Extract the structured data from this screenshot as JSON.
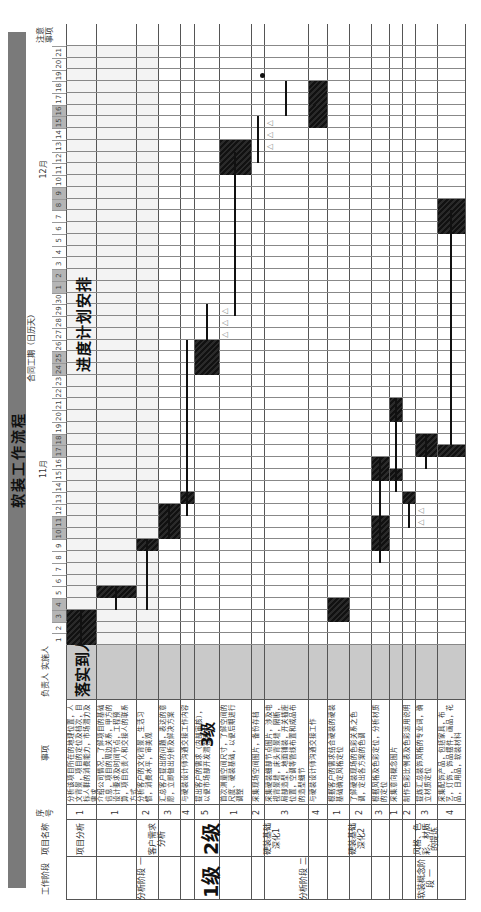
{
  "document": {
    "title": "软装工作流程",
    "contract_period_label": "合同工期（日历天）",
    "plan_label": "进度计划安排",
    "implementer_overlay": "落实到人",
    "level1_overlay": "1级",
    "level2_overlay": "2级",
    "level3_overlay": "3级",
    "headers": {
      "work_stage": "工作阶段",
      "project_name": "项目名称",
      "seq_no": "序号",
      "matters": "事项",
      "responsible": "负责人",
      "implementer": "实施人",
      "notes": "注意事项"
    },
    "months": [
      {
        "label": "11月",
        "start_day": 1,
        "days": 30
      },
      {
        "label": "12月",
        "start_day": 1,
        "days": 21
      }
    ],
    "weekend_days": [
      3,
      4,
      10,
      11,
      17,
      18,
      24,
      25,
      31,
      32,
      38,
      39,
      45,
      46
    ],
    "stages": [
      {
        "label": "分析阶段",
        "number": "一",
        "rows": [
          0,
          5
        ]
      },
      {
        "label": "分析阶段",
        "number": "二",
        "rows": [
          6,
          12
        ]
      },
      {
        "label": "软装概念阶段",
        "number": "一",
        "rows": [
          13,
          16
        ]
      }
    ],
    "projects": [
      {
        "label": "项目分析",
        "number": "一",
        "rows": [
          0,
          0
        ]
      },
      {
        "label": "客户需求分析",
        "number": "二",
        "rows": [
          1,
          5
        ]
      },
      {
        "label": "硬装基础深化1",
        "number": "三",
        "rows": [
          6,
          9
        ]
      },
      {
        "label": "硬装基础深化2",
        "number": "三",
        "rows": [
          10,
          12
        ]
      },
      {
        "label": "风格、色彩、材质的提炼",
        "number": "四",
        "rows": [
          13,
          16
        ]
      }
    ],
    "tasks": [
      {
        "seq": "1",
        "text": "分析该项目所在的地理位置，人文背景，项目的定位及档次，目标人群的消费能力，市场潜力及需求"
      },
      {
        "seq": "1",
        "text": "介绍公司情况，了解项目的基础信息，项目的周边关系，甲方的设计要求及时间节点，工程预算，项目负责人和交接人的联系方式"
      },
      {
        "seq": "2",
        "text": "分析客户的文化背景，生活习惯，消费水平，审美观"
      },
      {
        "seq": "3",
        "text": "汇总客户提出的问题，表达的意愿，立即做出分析及解决方案"
      },
      {
        "seq": "4",
        "text": "与硬装设计师沟通交接工作内容"
      },
      {
        "seq": "5",
        "text": "提出客户的需求（内部审核），以便市场部开发潜在客户"
      },
      {
        "seq": "1",
        "text": "首次测量空间尺寸，了解空间的尺度、硬装基础，以便后期进行调整"
      },
      {
        "seq": "2",
        "text": "采集现场空间图片，备份存档"
      },
      {
        "seq": "3",
        "text": "采集硬装细部节点图片，涉及电视背景墙，床头背景墙，隔断，局部造型，地面铺装，开关插座位置，空调等管线布置和成品布的造型细节"
      },
      {
        "seq": "4",
        "text": "与硬装设计师沟通交接工作"
      },
      {
        "seq": "1",
        "text": "根据客户的需求结合硬装的硬装基础确定风格定位"
      },
      {
        "seq": "2",
        "text": "了解硬装现场的色彩关系之色调，定出各方案的色调"
      },
      {
        "seq": "3",
        "text": "根据风格及色彩定位，分析材质的定位"
      },
      {
        "seq": "1",
        "text": "采集意向概念图片"
      },
      {
        "seq": "2",
        "text": "制作色彩比例表及色彩运用说明"
      },
      {
        "seq": "3",
        "text": "提炼汇总装饰风格的专业词，确立材质定位"
      },
      {
        "seq": "4",
        "text": "采集配饰产品，包括家具，布艺，灯饰，饰品摆件，画品，花品，日用品，软装材料"
      }
    ],
    "triangle_marker": "△"
  },
  "chart_data": {
    "type": "gantt",
    "x_axis": {
      "label": "合同工期（日历天）",
      "range": [
        "11月1日",
        "12月21日"
      ],
      "day_count": 51
    },
    "rows": 17,
    "bars": [
      {
        "row": 0,
        "start": 1,
        "end": 3
      },
      {
        "row": 1,
        "start": 5,
        "end": 5
      },
      {
        "row": 2,
        "start": 9,
        "end": 9
      },
      {
        "row": 3,
        "start": 10,
        "end": 12
      },
      {
        "row": 4,
        "start": 13,
        "end": 13
      },
      {
        "row": 5,
        "start": 24,
        "end": 26
      },
      {
        "row": 6,
        "start": 41,
        "end": 43
      },
      {
        "row": 9,
        "start": 47,
        "end": 48
      },
      {
        "row": 9,
        "start": 45,
        "end": 46
      },
      {
        "row": 10,
        "start": 3,
        "end": 4
      },
      {
        "row": 12,
        "start": 15,
        "end": 16
      },
      {
        "row": 12,
        "start": 9,
        "end": 11
      },
      {
        "row": 13,
        "start": 20,
        "end": 21
      },
      {
        "row": 13,
        "start": 15,
        "end": 15
      },
      {
        "row": 14,
        "start": 13,
        "end": 13
      },
      {
        "row": 15,
        "start": 17,
        "end": 18
      },
      {
        "row": 16,
        "start": 36,
        "end": 38
      },
      {
        "row": 16,
        "start": 17,
        "end": 17
      }
    ],
    "stems": [
      {
        "row": 0,
        "from": 1,
        "to": 3
      },
      {
        "row": 1,
        "from": 4,
        "to": 5
      },
      {
        "row": 2,
        "from": 4,
        "to": 9
      },
      {
        "row": 3,
        "from": 10,
        "to": 12
      },
      {
        "row": 4,
        "from": 12,
        "to": 26
      },
      {
        "row": 5,
        "from": 27,
        "to": 29
      },
      {
        "row": 6,
        "from": 29,
        "to": 42
      },
      {
        "row": 7,
        "from": 42,
        "to": 45
      },
      {
        "row": 8,
        "from": 46,
        "to": 48
      },
      {
        "row": 12,
        "from": 8,
        "to": 16
      },
      {
        "row": 13,
        "from": 14,
        "to": 21
      },
      {
        "row": 14,
        "from": 11,
        "to": 12
      },
      {
        "row": 15,
        "from": 16,
        "to": 18
      },
      {
        "row": 16,
        "from": 18,
        "to": 37
      }
    ],
    "triangles": [
      {
        "row": 5,
        "days": [
          27,
          28,
          29
        ]
      },
      {
        "row": 7,
        "days": [
          43,
          44,
          45
        ]
      },
      {
        "row": 14,
        "days": [
          11,
          12
        ]
      }
    ],
    "dot": {
      "row": 8,
      "day": 49
    }
  }
}
